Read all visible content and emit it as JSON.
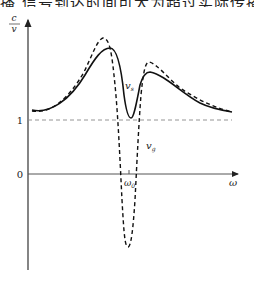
{
  "header": {
    "cropped_text": "播  信号到达时间可大为超过实际传播时"
  },
  "diagram": {
    "y_axis_label_numerator": "c",
    "y_axis_label_denominator": "v",
    "x_axis_label": "ω",
    "tick_one": "1",
    "tick_zero": "0",
    "resonance_label": "ω",
    "resonance_subscript": "0",
    "curve_solid_label": "v",
    "curve_solid_subscript": "s",
    "curve_dashed_label": "v",
    "curve_dashed_subscript": "g",
    "colors": {
      "curve": "#111111",
      "reference_line": "#888888",
      "axis": "#333333"
    }
  }
}
